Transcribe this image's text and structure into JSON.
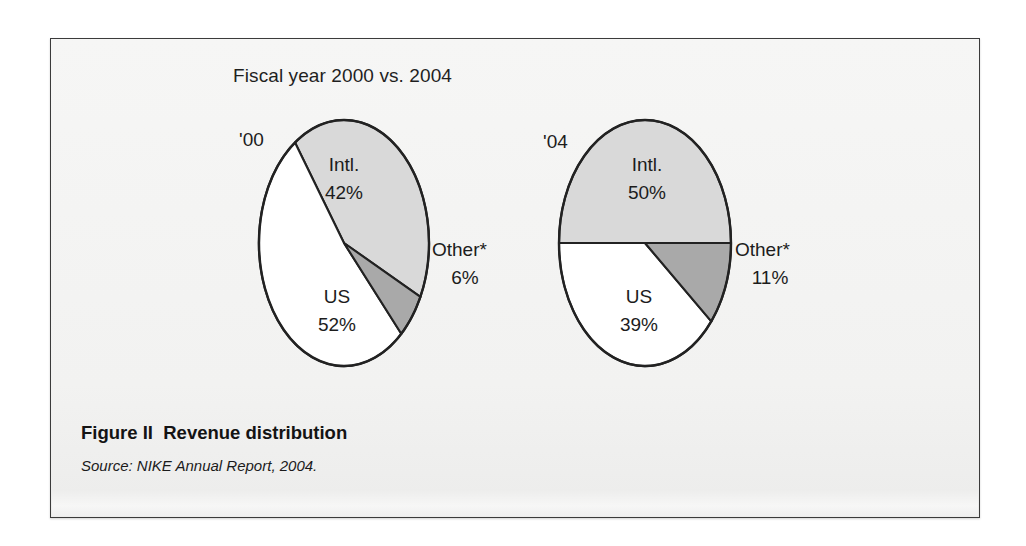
{
  "figure": {
    "title": "Fiscal year 2000 vs. 2004",
    "caption_label": "Figure II",
    "caption_title": "Revenue distribution",
    "source": "Source: NIKE Annual Report, 2004."
  },
  "colors": {
    "intl": "#d9d9d9",
    "us": "#ffffff",
    "other": "#a9a9a9",
    "outline": "#222222",
    "panel_bg": "#f4f4f3",
    "panel_border": "#3b3b3b",
    "text": "#1a1a1a"
  },
  "chart_data": {
    "type": "pie",
    "title": "Fiscal year 2000 vs. 2004",
    "xlabel": "",
    "ylabel": "",
    "legend_position": "none",
    "grid": false,
    "charts": [
      {
        "name": "'00",
        "year_label": "'00",
        "categories": [
          "Intl.",
          "US",
          "Other*"
        ],
        "values": [
          42,
          52,
          6
        ],
        "labels": [
          "Intl.\n42%",
          "US\n52%",
          "Other*\n6%"
        ],
        "slices": [
          {
            "label": "Intl.",
            "value_text": "42%",
            "value": 42,
            "color": "#d9d9d9"
          },
          {
            "label": "US",
            "value_text": "52%",
            "value": 52,
            "color": "#ffffff"
          },
          {
            "label": "Other*",
            "value_text": "6%",
            "value": 6,
            "color": "#a9a9a9"
          }
        ]
      },
      {
        "name": "'04",
        "year_label": "'04",
        "categories": [
          "Intl.",
          "US",
          "Other*"
        ],
        "values": [
          50,
          39,
          11
        ],
        "labels": [
          "Intl.\n50%",
          "US\n39%",
          "Other*\n11%"
        ],
        "slices": [
          {
            "label": "Intl.",
            "value_text": "50%",
            "value": 50,
            "color": "#d9d9d9"
          },
          {
            "label": "US",
            "value_text": "39%",
            "value": 39,
            "color": "#ffffff"
          },
          {
            "label": "Other*",
            "value_text": "11%",
            "value": 11,
            "color": "#a9a9a9"
          }
        ]
      }
    ]
  },
  "pie_left": {
    "year": "'00",
    "intl_name": "Intl.",
    "intl_pct": "42%",
    "us_name": "US",
    "us_pct": "52%",
    "other_name": "Other*",
    "other_pct": "6%"
  },
  "pie_right": {
    "year": "'04",
    "intl_name": "Intl.",
    "intl_pct": "50%",
    "us_name": "US",
    "us_pct": "39%",
    "other_name": "Other*",
    "other_pct": "11%"
  }
}
